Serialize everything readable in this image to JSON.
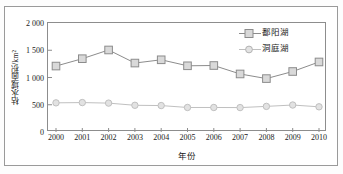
{
  "chart_data": {
    "type": "line",
    "title": "",
    "subtitle": "",
    "xlabel": "年份",
    "ylabel": "枯水域面积/km²",
    "x": [
      2000,
      2001,
      2002,
      2003,
      2004,
      2005,
      2006,
      2007,
      2008,
      2009,
      2010
    ],
    "categories": [
      "2000",
      "2001",
      "2002",
      "2003",
      "2004",
      "2005",
      "2006",
      "2007",
      "2008",
      "2009",
      "2010"
    ],
    "xlim": [
      1999.5,
      2010.5
    ],
    "ylim": [
      0,
      2000
    ],
    "ytick_labels": [
      "0",
      "500",
      "1 000",
      "1 500",
      "2 000"
    ],
    "ytick_values": [
      0,
      500,
      1000,
      1500,
      2000
    ],
    "grid": false,
    "legend_position": "top-right",
    "series": [
      {
        "name": "鄱阳湖",
        "marker": "square",
        "color": "#8c8c8c",
        "marker_fill": "#d9d9d9",
        "values": [
          1210,
          1345,
          1505,
          1265,
          1325,
          1215,
          1220,
          1065,
          980,
          1110,
          1285
        ]
      },
      {
        "name": "洞庭湖",
        "marker": "circle",
        "color": "#c0c0c0",
        "marker_fill": "#e2e2e2",
        "values": [
          535,
          540,
          530,
          490,
          485,
          450,
          450,
          448,
          470,
          495,
          462
        ]
      }
    ]
  },
  "figure": {
    "frame_color": "#9a9a9a",
    "axis_color": "#8d8d8d",
    "text_color": "#1a1a1a"
  }
}
